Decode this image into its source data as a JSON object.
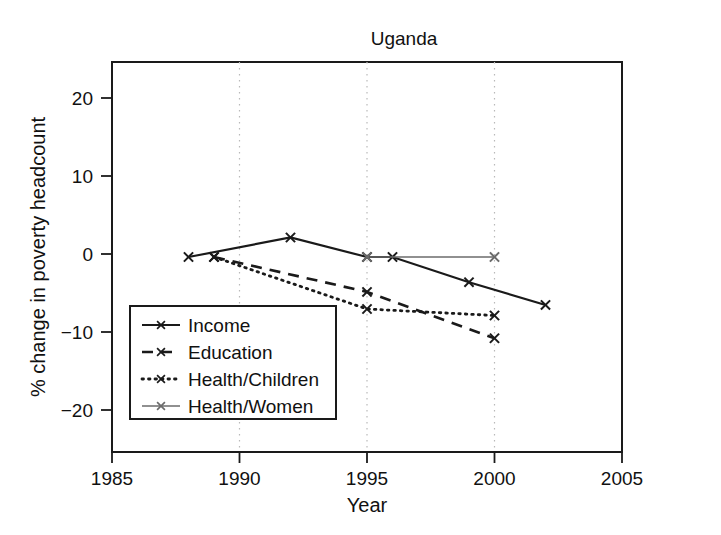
{
  "chart_data": {
    "type": "line",
    "title": "Uganda",
    "xlabel": "Year",
    "ylabel": "% change in poverty headcount",
    "xlim": [
      1985,
      2005
    ],
    "ylim": [
      -24,
      24
    ],
    "xticks": [
      "1985",
      "1990",
      "1995",
      "2000",
      "2005"
    ],
    "xtick_values": [
      1985,
      1990,
      1995,
      2000,
      2005
    ],
    "yticks": [
      "20",
      "10",
      "0",
      "−10",
      "−20"
    ],
    "ytick_values": [
      20,
      10,
      0,
      -10,
      -20
    ],
    "grid": "vertical-dotted",
    "legend_position": "lower-left-inside",
    "marker": "x",
    "series": [
      {
        "name": "Income",
        "style": "solid",
        "color": "#1a1a1a",
        "x": [
          1988,
          1992,
          1995,
          1996,
          1999,
          2002
        ],
        "y": [
          0.0,
          2.4,
          0.0,
          0.0,
          -3.1,
          -5.9
        ]
      },
      {
        "name": "Education",
        "style": "dashed",
        "color": "#1a1a1a",
        "x": [
          1989,
          1995,
          2000
        ],
        "y": [
          0.0,
          -4.3,
          -10.0
        ]
      },
      {
        "name": "Health/Children",
        "style": "dotted",
        "color": "#1a1a1a",
        "x": [
          1989,
          1995,
          2000
        ],
        "y": [
          0.0,
          -6.4,
          -7.2
        ]
      },
      {
        "name": "Health/Women",
        "style": "solid-thin",
        "color": "#6b6b6b",
        "x": [
          1995,
          2000
        ],
        "y": [
          0.0,
          0.0
        ]
      }
    ]
  },
  "legend": {
    "entries": [
      {
        "label": "Income",
        "style": "solid"
      },
      {
        "label": "Education",
        "style": "dashed"
      },
      {
        "label": "Health/Children",
        "style": "dotted"
      },
      {
        "label": "Health/Women",
        "style": "solid-thin"
      }
    ]
  }
}
